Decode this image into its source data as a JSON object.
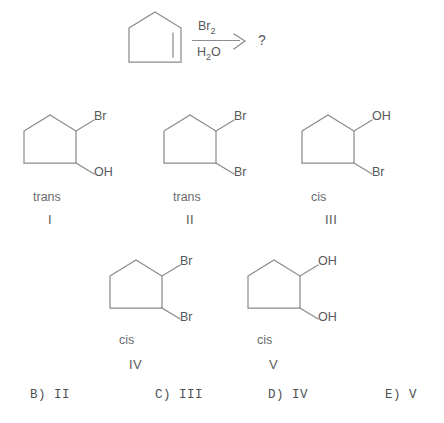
{
  "question": {
    "reaction": {
      "substrate_name": "cyclopentene",
      "reagent_top": "Br",
      "reagent_top_sub": "2",
      "reagent_bottom_1": "H",
      "reagent_bottom_sub": "2",
      "reagent_bottom_2": "O",
      "product_placeholder": "?"
    }
  },
  "structures": [
    {
      "id": "I",
      "roman": "I",
      "stereo": "trans",
      "top_label": "Br",
      "bottom_label": "OH"
    },
    {
      "id": "II",
      "roman": "II",
      "stereo": "trans",
      "top_label": "Br",
      "bottom_label": "Br"
    },
    {
      "id": "III",
      "roman": "III",
      "stereo": "cis",
      "top_label": "OH",
      "bottom_label": "Br"
    },
    {
      "id": "IV",
      "roman": "IV",
      "stereo": "cis",
      "top_label": "Br",
      "bottom_label": "Br"
    },
    {
      "id": "V",
      "roman": "V",
      "stereo": "cis",
      "top_label": "OH",
      "bottom_label": "OH"
    }
  ],
  "answer_choices": [
    {
      "label": "B) II"
    },
    {
      "label": "C) III"
    },
    {
      "label": "D) IV"
    },
    {
      "label": "E) V"
    }
  ],
  "colors": {
    "bond": "#8a8c8e",
    "text": "#58595b",
    "background": "#ffffff"
  }
}
